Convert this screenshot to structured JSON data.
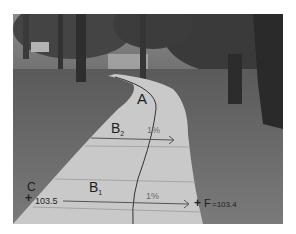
{
  "image": {
    "description": "Grayscale photo of a curving concrete footpath through a tree-lined park, annotated with survey labels and cross-slope arrows",
    "annotations": {
      "point_a": "A",
      "cross_section_b2": {
        "letter": "B",
        "subscript": "2",
        "slope": "1%"
      },
      "cross_section_b1": {
        "letter": "B",
        "subscript": "1",
        "slope": "1%"
      },
      "point_c": {
        "label": "C",
        "marker": "+",
        "elevation": "103.5"
      },
      "point_f": {
        "marker": "+",
        "label": "F",
        "elevation": "=103.4"
      }
    }
  }
}
